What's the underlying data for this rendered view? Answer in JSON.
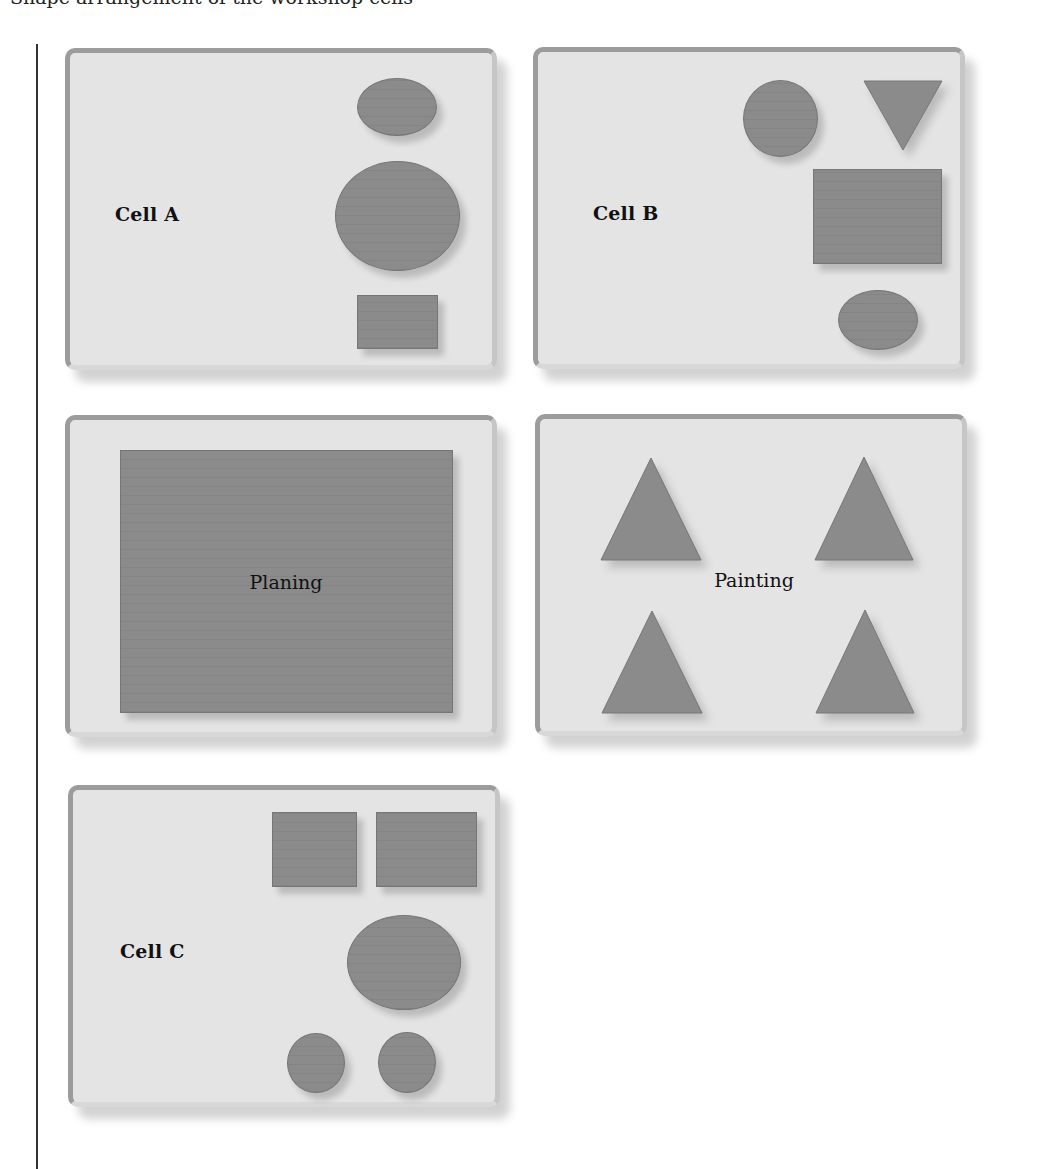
{
  "page": {
    "cutoff_header_text": "Shape arrangement of the workshop cells"
  },
  "colors": {
    "card_background": "#e4e4e4",
    "card_border": "#9c9c9c",
    "shape_fill": "#8b8b8b",
    "shape_edge": "#767676",
    "text": "#111111"
  },
  "cells": [
    {
      "label": "Cell A",
      "label_style": "bold",
      "shapes": [
        "small-ellipse",
        "large-circle",
        "small-rectangle"
      ]
    },
    {
      "label": "Cell B",
      "label_style": "bold",
      "shapes": [
        "circle",
        "inverted-triangle",
        "large-rectangle",
        "small-ellipse"
      ]
    },
    {
      "label": "Planing",
      "label_style": "regular",
      "shapes": [
        "large-board"
      ]
    },
    {
      "label": "Painting",
      "label_style": "regular",
      "shapes": [
        "triangle",
        "triangle",
        "triangle",
        "triangle"
      ]
    },
    {
      "label": "Cell C",
      "label_style": "bold",
      "shapes": [
        "square",
        "square",
        "large-ellipse",
        "small-circle",
        "small-circle"
      ]
    }
  ]
}
